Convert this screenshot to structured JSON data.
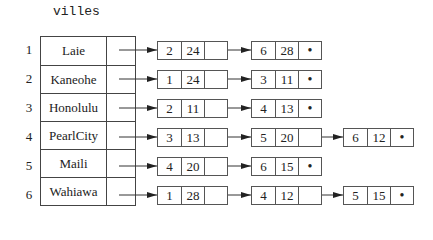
{
  "title": "villes",
  "rows": [
    {
      "index": "1",
      "name": "Laie",
      "list": [
        [
          "2",
          "24"
        ],
        [
          "6",
          "28"
        ]
      ]
    },
    {
      "index": "2",
      "name": "Kaneohe",
      "list": [
        [
          "1",
          "24"
        ],
        [
          "3",
          "11"
        ]
      ]
    },
    {
      "index": "3",
      "name": "Honolulu",
      "list": [
        [
          "2",
          "11"
        ],
        [
          "4",
          "13"
        ]
      ]
    },
    {
      "index": "4",
      "name": "PearlCity",
      "list": [
        [
          "3",
          "13"
        ],
        [
          "5",
          "20"
        ],
        [
          "6",
          "12"
        ]
      ]
    },
    {
      "index": "5",
      "name": "Maili",
      "list": [
        [
          "4",
          "20"
        ],
        [
          "6",
          "15"
        ]
      ]
    },
    {
      "index": "6",
      "name": "Wahiawa",
      "list": [
        [
          "1",
          "28"
        ],
        [
          "4",
          "12"
        ],
        [
          "5",
          "15"
        ]
      ]
    }
  ],
  "null_symbol": "•",
  "colors": {
    "line": "#444444",
    "background": "#ffffff"
  }
}
